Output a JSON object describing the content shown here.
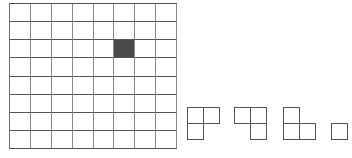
{
  "board": {
    "rows": 8,
    "cols": 8,
    "filled_cells": [
      [
        2,
        5
      ]
    ],
    "colors": {
      "grid_line": "#555555",
      "filled": "#4a4a4a",
      "background": "#ffffff"
    }
  },
  "pieces": [
    {
      "name": "l-tromino-missing-bottom-right",
      "cells": [
        [
          0,
          0
        ],
        [
          0,
          1
        ],
        [
          1,
          0
        ]
      ],
      "x": 187,
      "y": 107
    },
    {
      "name": "l-tromino-missing-bottom-left",
      "cells": [
        [
          0,
          0
        ],
        [
          0,
          1
        ],
        [
          1,
          1
        ]
      ],
      "x": 234,
      "y": 107
    },
    {
      "name": "l-tromino-missing-top-right",
      "cells": [
        [
          0,
          0
        ],
        [
          1,
          0
        ],
        [
          1,
          1
        ]
      ],
      "x": 283,
      "y": 107
    },
    {
      "name": "l-tromino-partial",
      "cells": [
        [
          1,
          0
        ]
      ],
      "x": 331,
      "y": 107
    }
  ],
  "caption": ""
}
